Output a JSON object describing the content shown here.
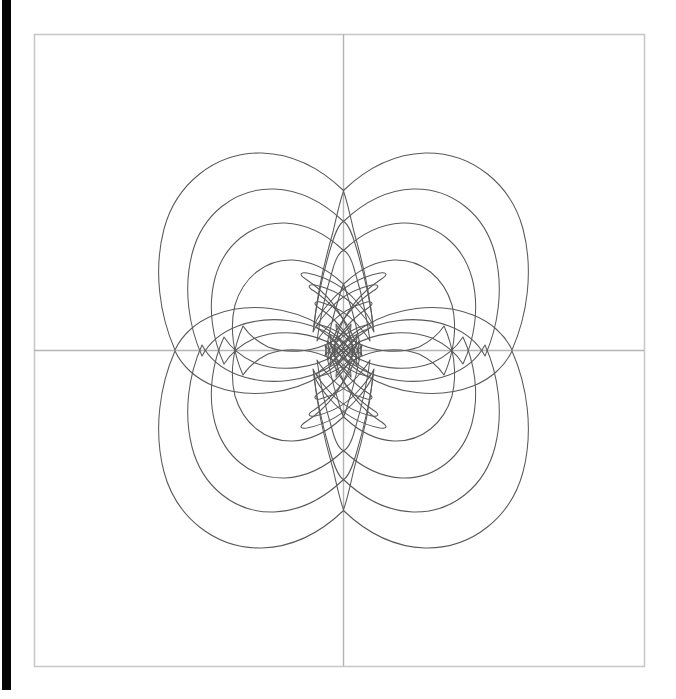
{
  "figure": {
    "title": "",
    "background_color": "#ffffff",
    "frame_color": "#c8c8c8",
    "axis_color": "#b4b4b4",
    "contour_color": "#595959",
    "sidebar_color": "#050505"
  },
  "frame": {
    "left": 34,
    "top": 34,
    "right": 644,
    "bottom": 666,
    "width": 610,
    "height": 632
  },
  "axes": {
    "origin_x": 343,
    "origin_y": 350,
    "xlabel": "",
    "ylabel": "",
    "xticks": [],
    "yticks": [],
    "xlim": [
      -1,
      1
    ],
    "ylim": [
      -1,
      1
    ],
    "grid": false
  },
  "chart_data": {
    "type": "line",
    "title": "",
    "subtitle": "",
    "xlabel": "",
    "ylabel": "",
    "xlim": [
      -1,
      1
    ],
    "ylim": [
      -1,
      1
    ],
    "grid": false,
    "legend": [],
    "annotations": [],
    "symmetry": "mirror about vertical axis x=343 and horizontal axis y=350",
    "levels": [
      1,
      2,
      3,
      4
    ],
    "level_count": 4,
    "quadrants": [
      "top-left",
      "top-right",
      "bottom-left",
      "bottom-right"
    ],
    "series": [
      {
        "name": "contour-level-1-outer",
        "level": 1,
        "extent_x": [
          155,
          532
        ],
        "extent_y": [
          155,
          545
        ],
        "cusp_points": [
          [
            343,
            190
          ],
          [
            175,
            350
          ],
          [
            511,
            350
          ],
          [
            343,
            512
          ]
        ]
      },
      {
        "name": "contour-level-2",
        "level": 2,
        "extent_x": [
          190,
          500
        ],
        "extent_y": [
          188,
          512
        ]
      },
      {
        "name": "contour-level-3",
        "level": 3,
        "extent_x": [
          218,
          472
        ],
        "extent_y": [
          214,
          486
        ]
      },
      {
        "name": "contour-level-4-inner",
        "level": 4,
        "extent_x": [
          240,
          450
        ],
        "extent_y": [
          238,
          462
        ]
      }
    ]
  }
}
